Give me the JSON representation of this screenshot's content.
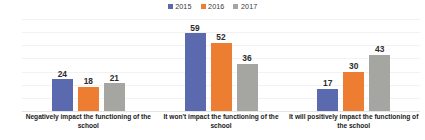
{
  "chart_data": {
    "type": "bar",
    "title": "",
    "xlabel": "",
    "ylabel": "",
    "ylim": [
      0,
      70
    ],
    "ytick_step": 10,
    "yticks": [
      70,
      60,
      50,
      40,
      30,
      20,
      10,
      0
    ],
    "grid": true,
    "legend_position": "top-center",
    "categories": [
      "Negatively impact the functioning of the school",
      "It won't impact the functioning of the school",
      "It will positively impact the functioning of the school"
    ],
    "series": [
      {
        "name": "2015",
        "color": "#5B6AAE",
        "values": [
          24,
          59,
          17
        ]
      },
      {
        "name": "2016",
        "color": "#ED7D31",
        "values": [
          18,
          52,
          30
        ]
      },
      {
        "name": "2017",
        "color": "#A5A5A1",
        "values": [
          21,
          36,
          43
        ]
      }
    ]
  },
  "legend": {
    "items": [
      {
        "label": "2015",
        "color": "#5B6AAE"
      },
      {
        "label": "2016",
        "color": "#ED7D31"
      },
      {
        "label": "2017",
        "color": "#A5A5A1"
      }
    ]
  },
  "axis": {
    "yticks": [
      "70",
      "60",
      "50",
      "40",
      "30",
      "20",
      "10",
      "0"
    ]
  },
  "labels": {
    "groups": [
      "Negatively impact the functioning of the school",
      "It won't impact the functioning of the school",
      "It will positively impact the functioning of the school"
    ],
    "values": {
      "g0": [
        "24",
        "18",
        "21"
      ],
      "g1": [
        "59",
        "52",
        "36"
      ],
      "g2": [
        "17",
        "30",
        "43"
      ]
    }
  }
}
